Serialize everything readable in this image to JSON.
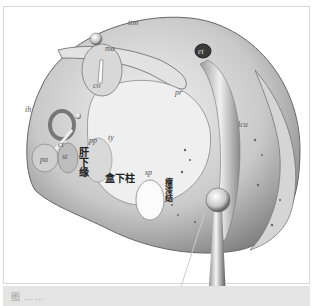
{
  "figure": {
    "type": "anatomical-illustration",
    "labels_latin": {
      "ttm": "ttm",
      "ma": "ma",
      "co": "co",
      "et": "et",
      "pr": "pr",
      "lcu": "lcu",
      "ih": "ih",
      "ct": "ct",
      "pa": "pa",
      "st": "st",
      "pp": "pp",
      "ty": "ty",
      "sp": "sp"
    },
    "labels_chinese": {
      "left_vertical": "肝下缘",
      "center": "盒下柱",
      "right_vertical": "瘤漆结"
    },
    "signature": "Hidalgo",
    "caption": "图 ……"
  },
  "colors": {
    "frame_border": "#d8d8d8",
    "caption_strip": "#e4e4e4",
    "tissue_light": "#e8e8e8",
    "tissue_mid": "#b0b0b0",
    "tissue_dark": "#555555"
  }
}
